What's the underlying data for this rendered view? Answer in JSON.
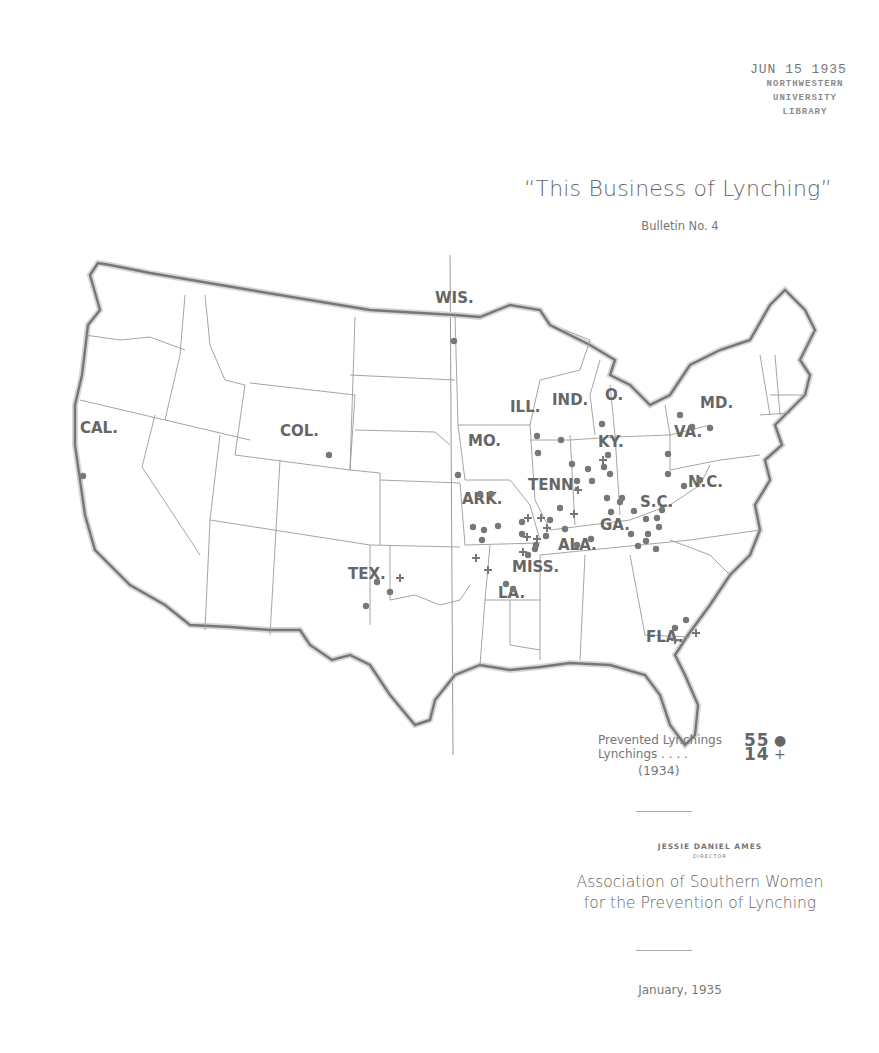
{
  "stamp": {
    "date": "JUN 15 1935",
    "lines": [
      "NORTHWESTERN",
      "UNIVERSITY",
      "LIBRARY"
    ]
  },
  "header": {
    "title": "“This Business of Lynching”",
    "subtitle": "Bulletin No. 4"
  },
  "map": {
    "states_labeled": [
      {
        "abbr": "WIS.",
        "x": 385,
        "y": 103,
        "prevented": 1,
        "lynchings": 0
      },
      {
        "abbr": "CAL.",
        "x": 30,
        "y": 233,
        "prevented": 1,
        "lynchings": 0
      },
      {
        "abbr": "COL.",
        "x": 230,
        "y": 236,
        "prevented": 1,
        "lynchings": 0
      },
      {
        "abbr": "ILL.",
        "x": 460,
        "y": 212,
        "prevented": 2,
        "lynchings": 0
      },
      {
        "abbr": "IND.",
        "x": 502,
        "y": 205,
        "prevented": 1,
        "lynchings": 0
      },
      {
        "abbr": "O.",
        "x": 555,
        "y": 200,
        "prevented": 1,
        "lynchings": 0
      },
      {
        "abbr": "MD.",
        "x": 650,
        "y": 208,
        "prevented": 3,
        "lynchings": 0
      },
      {
        "abbr": "MO.",
        "x": 418,
        "y": 246,
        "prevented": 1,
        "lynchings": 0
      },
      {
        "abbr": "KY.",
        "x": 548,
        "y": 247,
        "prevented": 2,
        "lynchings": 1
      },
      {
        "abbr": "VA.",
        "x": 624,
        "y": 237,
        "prevented": 1,
        "lynchings": 0
      },
      {
        "abbr": "N.C.",
        "x": 638,
        "y": 287,
        "prevented": 3,
        "lynchings": 0
      },
      {
        "abbr": "TENN.",
        "x": 478,
        "y": 290,
        "prevented": 4,
        "lynchings": 1
      },
      {
        "abbr": "ARK.",
        "x": 412,
        "y": 304,
        "prevented": 4,
        "lynchings": 0
      },
      {
        "abbr": "S.C.",
        "x": 590,
        "y": 307,
        "prevented": 5,
        "lynchings": 0
      },
      {
        "abbr": "GA.",
        "x": 550,
        "y": 330,
        "prevented": 9,
        "lynchings": 0
      },
      {
        "abbr": "ALA.",
        "x": 508,
        "y": 350,
        "prevented": 6,
        "lynchings": 1
      },
      {
        "abbr": "MISS.",
        "x": 462,
        "y": 372,
        "prevented": 6,
        "lynchings": 6
      },
      {
        "abbr": "LA.",
        "x": 448,
        "y": 398,
        "prevented": 2,
        "lynchings": 2
      },
      {
        "abbr": "TEX.",
        "x": 298,
        "y": 379,
        "prevented": 3,
        "lynchings": 1
      },
      {
        "abbr": "FLA.",
        "x": 596,
        "y": 442,
        "prevented": 2,
        "lynchings": 2
      }
    ],
    "markers": {
      "prevented": [
        [
          33,
          276
        ],
        [
          279,
          255
        ],
        [
          404,
          141
        ],
        [
          487,
          236
        ],
        [
          488,
          253
        ],
        [
          511,
          240
        ],
        [
          552,
          224
        ],
        [
          630,
          215
        ],
        [
          642,
          227
        ],
        [
          660,
          228
        ],
        [
          408,
          275
        ],
        [
          522,
          264
        ],
        [
          538,
          269
        ],
        [
          554,
          267
        ],
        [
          558,
          255
        ],
        [
          618,
          254
        ],
        [
          618,
          274
        ],
        [
          634,
          286
        ],
        [
          650,
          280
        ],
        [
          527,
          281
        ],
        [
          542,
          281
        ],
        [
          560,
          274
        ],
        [
          430,
          294
        ],
        [
          441,
          294
        ],
        [
          423,
          327
        ],
        [
          434,
          330
        ],
        [
          448,
          326
        ],
        [
          432,
          340
        ],
        [
          570,
          302
        ],
        [
          584,
          311
        ],
        [
          596,
          319
        ],
        [
          607,
          318
        ],
        [
          612,
          310
        ],
        [
          557,
          298
        ],
        [
          572,
          298
        ],
        [
          561,
          312
        ],
        [
          581,
          334
        ],
        [
          598,
          334
        ],
        [
          609,
          327
        ],
        [
          588,
          346
        ],
        [
          606,
          349
        ],
        [
          596,
          341
        ],
        [
          510,
          308
        ],
        [
          515,
          329
        ],
        [
          527,
          345
        ],
        [
          541,
          339
        ],
        [
          500,
          320
        ],
        [
          485,
          349
        ],
        [
          472,
          322
        ],
        [
          472,
          334
        ],
        [
          486,
          345
        ],
        [
          478,
          355
        ],
        [
          496,
          336
        ],
        [
          456,
          384
        ],
        [
          463,
          389
        ],
        [
          327,
          382
        ],
        [
          340,
          392
        ],
        [
          316,
          406
        ],
        [
          625,
          428
        ],
        [
          636,
          420
        ]
      ],
      "lynchings": [
        [
          553,
          260
        ],
        [
          528,
          290
        ],
        [
          478,
          318
        ],
        [
          491,
          318
        ],
        [
          497,
          328
        ],
        [
          477,
          337
        ],
        [
          487,
          339
        ],
        [
          473,
          352
        ],
        [
          524,
          314
        ],
        [
          426,
          358
        ],
        [
          438,
          370
        ],
        [
          350,
          378
        ],
        [
          646,
          433
        ],
        [
          625,
          440
        ]
      ]
    }
  },
  "legend": {
    "rows": [
      {
        "label": "Prevented Lynchings",
        "value": "55",
        "symbol": "●"
      },
      {
        "label": "Lynchings . . . .",
        "value": "14",
        "symbol": "+"
      }
    ],
    "year": "(1934)"
  },
  "footer": {
    "director_name": "JESSIE DANIEL AMES",
    "director_role": "DIRECTOR",
    "organization_line1": "Association of Southern Women",
    "organization_line2": "for the Prevention of Lynching",
    "date": "January, 1935"
  }
}
